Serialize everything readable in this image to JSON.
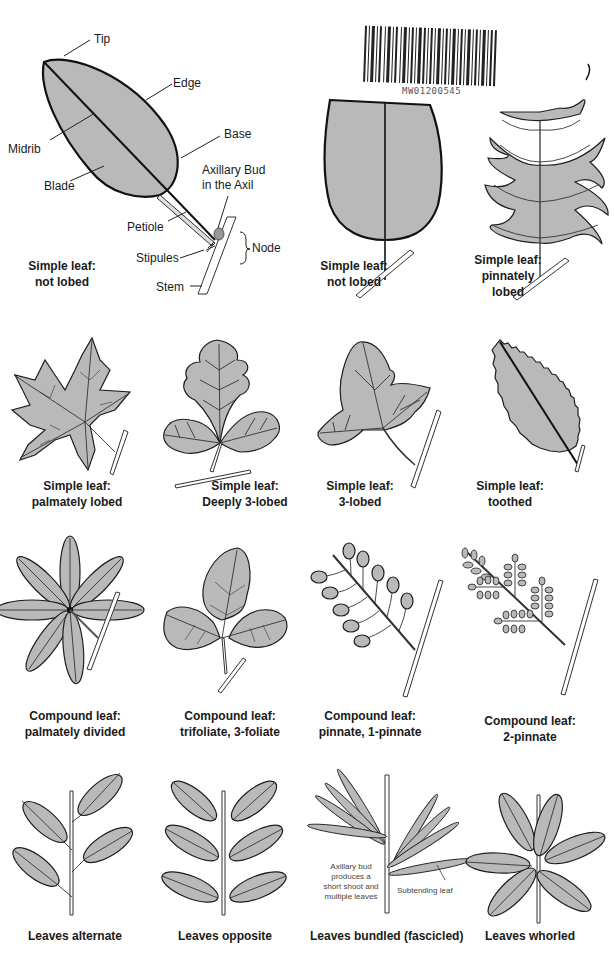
{
  "diagram": {
    "colors": {
      "leaf_fill": "#b9b9b9",
      "outline": "#1e1e1e",
      "background": "#ffffff"
    },
    "barcode": {
      "number": "MW01200545"
    },
    "anatomy": {
      "parts": {
        "tip": "Tip",
        "edge": "Edge",
        "midrib": "Midrib",
        "base": "Base",
        "blade": "Blade",
        "axillary_bud": "Axillary Bud",
        "axillary_bud_2": "in the Axil",
        "petiole": "Petiole",
        "stipules": "Stipules",
        "node": "Node",
        "stem": "Stem"
      },
      "caption": [
        "Simple leaf:",
        "not lobed"
      ]
    },
    "row1": [
      {
        "caption": [
          "Simple leaf:",
          "not lobed"
        ]
      },
      {
        "caption": [
          "Simple leaf:",
          "pinnately",
          "lobed"
        ]
      }
    ],
    "row2": [
      {
        "caption": [
          "Simple leaf:",
          "palmately lobed"
        ]
      },
      {
        "caption": [
          "Simple leaf:",
          "Deeply 3-lobed"
        ]
      },
      {
        "caption": [
          "Simple leaf:",
          "3-lobed"
        ]
      },
      {
        "caption": [
          "Simple leaf:",
          "toothed"
        ]
      }
    ],
    "row3": [
      {
        "caption": [
          "Compound leaf:",
          "palmately divided"
        ]
      },
      {
        "caption": [
          "Compound leaf:",
          "trifoliate, 3-foliate"
        ]
      },
      {
        "caption": [
          "Compound leaf:",
          "pinnate, 1-pinnate"
        ]
      },
      {
        "caption": [
          "Compound leaf:",
          "2-pinnate"
        ]
      }
    ],
    "row4": [
      {
        "caption": [
          "Leaves alternate"
        ]
      },
      {
        "caption": [
          "Leaves opposite"
        ]
      },
      {
        "caption": [
          "Leaves bundled (fascicled)"
        ],
        "note": [
          "Axillary bud",
          "produces a",
          "short shoot and",
          "multiple leaves"
        ],
        "pointer": "Subtending leaf"
      },
      {
        "caption": [
          "Leaves whorled"
        ]
      }
    ]
  }
}
